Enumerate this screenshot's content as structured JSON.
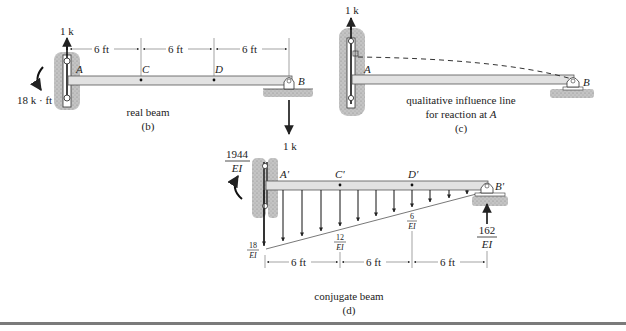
{
  "figure_b": {
    "caption": "real beam",
    "label": "(b)",
    "load_top": "1 k",
    "load_bottom": "1 k",
    "moment": "18 k · ft",
    "dims": [
      "6 ft",
      "6 ft",
      "6 ft"
    ],
    "points": {
      "A": "A",
      "C": "C",
      "D": "D",
      "B": "B"
    }
  },
  "figure_c": {
    "caption_line1": "qualitative influence line",
    "caption_line2_prefix": "for reaction at ",
    "caption_line2_var": "A",
    "label": "(c)",
    "load_top": "1 k",
    "points": {
      "A": "A",
      "B": "B"
    }
  },
  "figure_d": {
    "caption": "conjugate beam",
    "label": "(d)",
    "moment_num": "1944",
    "moment_den": "EI",
    "reaction_num": "162",
    "reaction_den": "EI",
    "load_A_num": "18",
    "load_A_den": "EI",
    "load_C_num": "12",
    "load_C_den": "EI",
    "load_D_num": "6",
    "load_D_den": "EI",
    "load_top": "1 k",
    "dims": [
      "6 ft",
      "6 ft",
      "6 ft"
    ],
    "points": {
      "A": "A'",
      "C": "C'",
      "D": "D'",
      "B": "B'"
    }
  },
  "colors": {
    "beam_fill": "#e2e2e2",
    "beam_stroke": "#555555",
    "ground": "#b0b0b0",
    "ink": "#222222"
  }
}
